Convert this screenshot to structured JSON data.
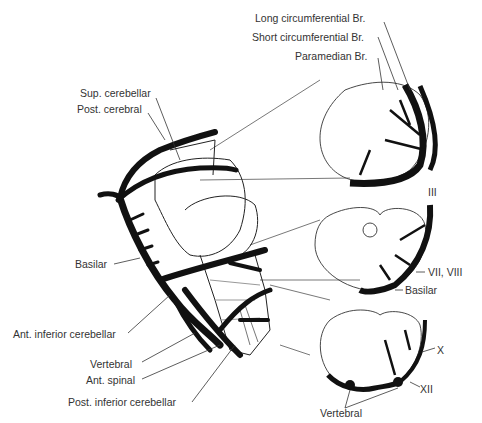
{
  "figure": {
    "colors": {
      "background": "#ffffff",
      "ink": "#111111",
      "label": "#333333"
    }
  },
  "labels": {
    "long_circ": "Long circumferential Br.",
    "short_circ": "Short circumferential Br.",
    "paramedian": "Paramedian Br.",
    "sup_cerebellar": "Sup. cerebellar",
    "post_cerebral": "Post. cerebral",
    "basilar_left": "Basilar",
    "ant_inf_cerebellar": "Ant. inferior cerebellar",
    "vertebral_left": "Vertebral",
    "ant_spinal": "Ant. spinal",
    "post_inf_cerebellar": "Post. inferior cerebellar",
    "nerve_iii": "III",
    "nerve_vii_viii": "VII, VIII",
    "basilar_right": "Basilar",
    "nerve_x": "X",
    "nerve_xii": "XII",
    "vertebral_right": "Vertebral"
  },
  "panels": [
    {
      "name": "brainstem-lateral-view"
    },
    {
      "name": "midbrain-cross-section",
      "nerve": "III"
    },
    {
      "name": "pons-cross-section",
      "nerve": "VII, VIII"
    },
    {
      "name": "medulla-cross-section",
      "nerve": "X, XII"
    }
  ]
}
